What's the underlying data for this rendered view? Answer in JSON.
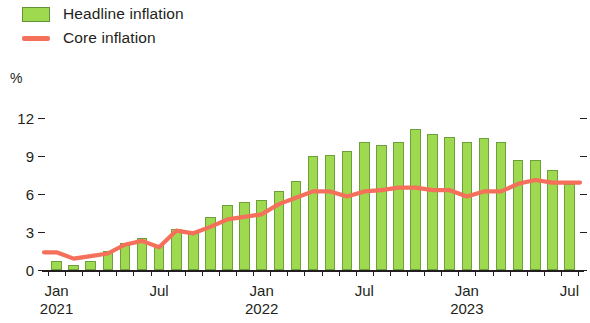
{
  "legend": {
    "items": [
      {
        "label": "Headline inflation",
        "marker": "bar-swatch",
        "color": "#9ed94f"
      },
      {
        "label": "Core inflation",
        "marker": "line-swatch",
        "color": "#f4705a"
      }
    ]
  },
  "axes": {
    "y_unit": "%",
    "y_ticks": [
      "12",
      "9",
      "6",
      "3",
      "0"
    ],
    "x_labels": [
      {
        "month": "Jan",
        "year": "2021",
        "index": 0
      },
      {
        "month": "Jul",
        "year": "",
        "index": 6
      },
      {
        "month": "Jan",
        "year": "2022",
        "index": 12
      },
      {
        "month": "Jul",
        "year": "",
        "index": 18
      },
      {
        "month": "Jan",
        "year": "2023",
        "index": 24
      },
      {
        "month": "Jul",
        "year": "",
        "index": 30
      }
    ]
  },
  "chart_data": {
    "type": "bar",
    "title": "",
    "subtitle": "",
    "xlabel": "",
    "ylabel": "%",
    "ylim": [
      0,
      13
    ],
    "yticks": [
      0,
      3,
      6,
      9,
      12
    ],
    "grid": false,
    "legend_position": "top-left",
    "categories": [
      "Jan 2021",
      "Feb 2021",
      "Mar 2021",
      "Apr 2021",
      "May 2021",
      "Jun 2021",
      "Jul 2021",
      "Aug 2021",
      "Sep 2021",
      "Oct 2021",
      "Nov 2021",
      "Dec 2021",
      "Jan 2022",
      "Feb 2022",
      "Mar 2022",
      "Apr 2022",
      "May 2022",
      "Jun 2022",
      "Jul 2022",
      "Aug 2022",
      "Sep 2022",
      "Oct 2022",
      "Nov 2022",
      "Dec 2022",
      "Jan 2023",
      "Feb 2023",
      "Mar 2023",
      "Apr 2023",
      "May 2023",
      "Jun 2023",
      "Jul 2023"
    ],
    "series": [
      {
        "name": "Headline inflation",
        "type": "bar",
        "color": "#9ed94f",
        "edge_color": "#6ba03b",
        "values": [
          0.7,
          0.4,
          0.7,
          1.5,
          2.1,
          2.5,
          2.0,
          3.2,
          3.1,
          4.2,
          5.1,
          5.4,
          5.5,
          6.2,
          7.0,
          9.0,
          9.1,
          9.4,
          10.1,
          9.9,
          10.1,
          11.1,
          10.7,
          10.5,
          10.1,
          10.4,
          10.1,
          8.7,
          8.7,
          7.9,
          6.8
        ]
      },
      {
        "name": "Core inflation",
        "type": "line",
        "color": "#f4705a",
        "values": [
          1.4,
          0.9,
          1.1,
          1.3,
          2.0,
          2.3,
          1.8,
          3.1,
          2.9,
          3.4,
          4.0,
          4.2,
          4.4,
          5.2,
          5.7,
          6.2,
          6.2,
          5.8,
          6.2,
          6.3,
          6.5,
          6.5,
          6.3,
          6.3,
          5.8,
          6.2,
          6.2,
          6.8,
          7.1,
          6.9,
          6.9
        ]
      }
    ]
  }
}
